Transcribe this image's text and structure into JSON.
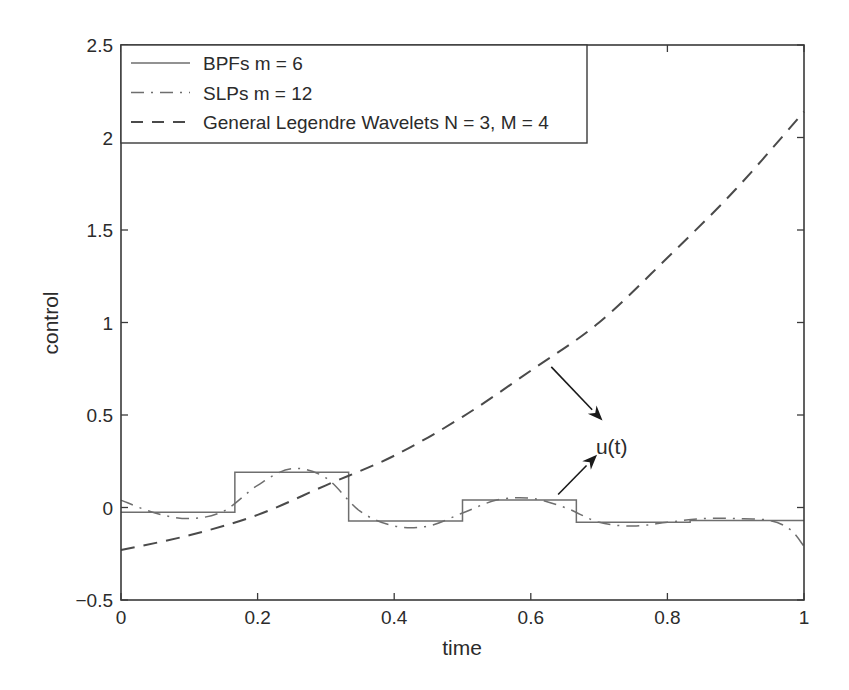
{
  "chart_data": {
    "type": "line",
    "title": "",
    "xlabel": "time",
    "ylabel": "control",
    "xlim": [
      0,
      1
    ],
    "ylim": [
      -0.5,
      2.5
    ],
    "xticks": [
      0,
      0.2,
      0.4,
      0.6,
      0.8,
      1
    ],
    "xtick_labels": [
      "0",
      "0.2",
      "0.4",
      "0.6",
      "0.8",
      "1"
    ],
    "yticks": [
      -0.5,
      0,
      0.5,
      1,
      1.5,
      2,
      2.5
    ],
    "ytick_labels": [
      "−0.5",
      "0",
      "0.5",
      "1",
      "1.5",
      "2",
      "2.5"
    ],
    "grid": false,
    "legend_position": "upper left",
    "series": [
      {
        "name": "BPFs m = 6",
        "style": "solid",
        "kind": "step",
        "color": "#6e6e6e",
        "x_edges": [
          0,
          0.1667,
          0.3333,
          0.5,
          0.6667,
          0.8333,
          1
        ],
        "values": [
          -0.025,
          0.19,
          -0.073,
          0.04,
          -0.08,
          -0.07
        ]
      },
      {
        "name": "SLPs m = 12",
        "style": "dashdot",
        "color": "#6e6e6e",
        "x": [
          0,
          0.05,
          0.1,
          0.15,
          0.2,
          0.25,
          0.3,
          0.35,
          0.4,
          0.45,
          0.5,
          0.55,
          0.6,
          0.65,
          0.7,
          0.75,
          0.8,
          0.85,
          0.9,
          0.95,
          0.98,
          1
        ],
        "values": [
          0.04,
          -0.03,
          -0.06,
          -0.02,
          0.12,
          0.21,
          0.16,
          -0.02,
          -0.1,
          -0.1,
          -0.03,
          0.04,
          0.05,
          0.0,
          -0.08,
          -0.1,
          -0.08,
          -0.06,
          -0.06,
          -0.07,
          -0.12,
          -0.21
        ]
      },
      {
        "name": "General Legendre Wavelets N = 3, M = 4",
        "style": "dashed",
        "color": "#4a4a4a",
        "x": [
          0,
          0.1,
          0.2,
          0.3,
          0.4,
          0.5,
          0.6,
          0.7,
          0.8,
          0.9,
          1
        ],
        "values": [
          -0.23,
          -0.15,
          -0.04,
          0.12,
          0.28,
          0.49,
          0.74,
          1.0,
          1.35,
          1.72,
          2.14
        ]
      }
    ],
    "annotations": [
      {
        "text": "u(t)",
        "x": 0.71,
        "y": 0.33,
        "arrows": [
          {
            "from": [
              0.63,
              0.76
            ],
            "to": [
              0.705,
              0.47
            ]
          },
          {
            "from": [
              0.64,
              0.07
            ],
            "to": [
              0.697,
              0.285
            ]
          }
        ]
      }
    ]
  }
}
